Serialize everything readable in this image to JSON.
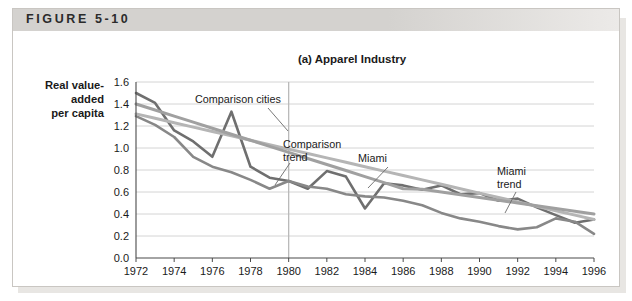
{
  "figure": {
    "label": "FIGURE 5-10",
    "banner_color": "#d4d2cf"
  },
  "chart_data": {
    "type": "line",
    "title": "(a) Apparel Industry",
    "xlabel": "",
    "ylabel": "Real value-added per capita",
    "ylabel_lines": [
      "Real value-",
      "added",
      "per capita"
    ],
    "xlim": [
      1972,
      1996
    ],
    "ylim": [
      0.0,
      1.6
    ],
    "ytick_labels": [
      "0.0",
      "0.2",
      "0.4",
      "0.6",
      "0.8",
      "1.0",
      "1.2",
      "1.4",
      "1.6"
    ],
    "yticks": [
      0.0,
      0.2,
      0.4,
      0.6,
      0.8,
      1.0,
      1.2,
      1.4,
      1.6
    ],
    "xtick_labels": [
      "1972",
      "1974",
      "1976",
      "1978",
      "1980",
      "1982",
      "1984",
      "1986",
      "1988",
      "1990",
      "1992",
      "1994",
      "1996"
    ],
    "xticks": [
      1972,
      1974,
      1976,
      1978,
      1980,
      1982,
      1984,
      1986,
      1988,
      1990,
      1992,
      1994,
      1996
    ],
    "grid": true,
    "legend_position": "inline-annotations",
    "reference_line": {
      "x": 1980,
      "color": "#b9b9b9",
      "label": ""
    },
    "x": [
      1972,
      1973,
      1974,
      1975,
      1976,
      1977,
      1978,
      1979,
      1980,
      1981,
      1982,
      1983,
      1984,
      1985,
      1986,
      1987,
      1988,
      1989,
      1990,
      1991,
      1992,
      1993,
      1994,
      1995,
      1996
    ],
    "series": [
      {
        "name": "Comparison cities",
        "color": "#6f6f6f",
        "width": 2.6,
        "values": [
          1.5,
          1.41,
          1.16,
          1.06,
          0.92,
          1.33,
          0.83,
          0.73,
          0.7,
          0.63,
          0.79,
          0.74,
          0.45,
          0.68,
          0.66,
          0.62,
          0.66,
          0.58,
          0.59,
          0.52,
          0.54,
          0.46,
          0.39,
          0.32,
          0.35
        ]
      },
      {
        "name": "Miami",
        "color": "#888888",
        "width": 2.6,
        "values": [
          1.29,
          1.21,
          1.1,
          0.92,
          0.83,
          0.78,
          0.71,
          0.63,
          0.7,
          0.65,
          0.63,
          0.58,
          0.56,
          0.55,
          0.52,
          0.48,
          0.41,
          0.36,
          0.33,
          0.29,
          0.26,
          0.28,
          0.36,
          0.33,
          0.22
        ]
      },
      {
        "name": "Comparison trend",
        "color": "#b5b5b5",
        "width": 3.0,
        "trend": true,
        "values": [
          1.31,
          1.27,
          1.23,
          1.19,
          1.15,
          1.11,
          1.07,
          1.03,
          0.99,
          0.95,
          0.91,
          0.87,
          0.83,
          0.79,
          0.75,
          0.71,
          0.67,
          0.63,
          0.59,
          0.55,
          0.51,
          0.47,
          0.43,
          0.39,
          0.35
        ]
      },
      {
        "name": "Miami trend",
        "color": "#a0a0a0",
        "width": 3.0,
        "trend": true,
        "values": [
          1.4,
          1.345,
          1.29,
          1.235,
          1.18,
          1.125,
          1.07,
          1.015,
          0.96,
          0.905,
          0.85,
          0.795,
          0.74,
          0.685,
          0.63,
          0.625,
          0.6,
          0.575,
          0.55,
          0.525,
          0.5,
          0.475,
          0.45,
          0.425,
          0.4
        ]
      }
    ],
    "annotations": [
      {
        "text": "Comparison cities",
        "x": 195,
        "y": 103,
        "anchor": "start",
        "leader": [
          [
            268,
            108
          ],
          [
            288,
            131
          ]
        ]
      },
      {
        "text_lines": [
          "Comparison",
          "trend"
        ],
        "x": 283,
        "y": 148,
        "anchor": "start",
        "leader": [
          [
            290,
            163
          ],
          [
            275,
            185
          ]
        ]
      },
      {
        "text": "Miami",
        "x": 358,
        "y": 162,
        "anchor": "start",
        "leader": [
          [
            388,
            167
          ],
          [
            368,
            188
          ]
        ]
      },
      {
        "text_lines": [
          "Miami",
          "trend"
        ],
        "x": 497,
        "y": 175,
        "anchor": "start",
        "leader": [
          [
            516,
            192
          ],
          [
            505,
            213
          ]
        ]
      }
    ]
  }
}
